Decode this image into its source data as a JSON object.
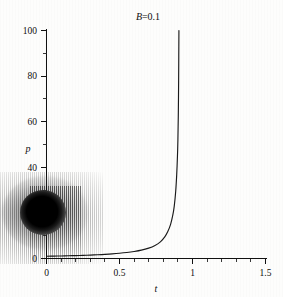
{
  "figure": {
    "title_prefix": "B",
    "title_suffix": "=0.1",
    "title_full": "B=0.1"
  },
  "axes": {
    "x_label": "t",
    "y_label": "p",
    "x_ticks": [
      "0",
      "0.5",
      "1",
      "1.5"
    ],
    "y_ticks": [
      "0",
      "20",
      "40",
      "60",
      "80",
      "100"
    ],
    "y_ticks_visible": [
      "0",
      "40",
      "60",
      "80",
      "100"
    ],
    "y_tick_hidden_note": "20"
  },
  "artifact": {
    "name": "ink-blob-scan-artifact",
    "description": "dark elliptical ink blob with vertical stripe scan noise obscuring lower-left axis region",
    "color": "#000000"
  },
  "colors": {
    "background": "#ffffff",
    "axis": "#111111",
    "curve": "#1a1a1a",
    "text": "#0d0d0d"
  },
  "chart_data": {
    "type": "line",
    "title": "B=0.1",
    "xlabel": "t",
    "ylabel": "p",
    "xlim": [
      0,
      1.5
    ],
    "ylim": [
      0,
      100
    ],
    "grid": false,
    "legend": null,
    "x_major_ticks": [
      0,
      0.5,
      1,
      1.5
    ],
    "y_major_ticks": [
      0,
      20,
      40,
      60,
      80,
      100
    ],
    "x_minor_tick_step": 0.1,
    "y_minor_tick_step": 10,
    "asymptote_t": 0.91,
    "series": [
      {
        "name": "p(t)",
        "x": [
          0.0,
          0.05,
          0.1,
          0.15,
          0.2,
          0.25,
          0.3,
          0.35,
          0.4,
          0.45,
          0.5,
          0.55,
          0.6,
          0.65,
          0.7,
          0.74,
          0.78,
          0.81,
          0.83,
          0.85,
          0.865,
          0.875,
          0.885,
          0.892,
          0.897,
          0.9,
          0.903,
          0.905,
          0.906,
          0.907
        ],
        "y": [
          1.0,
          1.05,
          1.12,
          1.19,
          1.28,
          1.38,
          1.5,
          1.64,
          1.81,
          2.02,
          2.28,
          2.61,
          3.05,
          3.65,
          4.55,
          5.6,
          7.3,
          9.5,
          11.7,
          15.0,
          19.0,
          23.0,
          29.5,
          37.0,
          45.0,
          52.0,
          64.0,
          78.0,
          89.0,
          100.0
        ]
      }
    ]
  }
}
